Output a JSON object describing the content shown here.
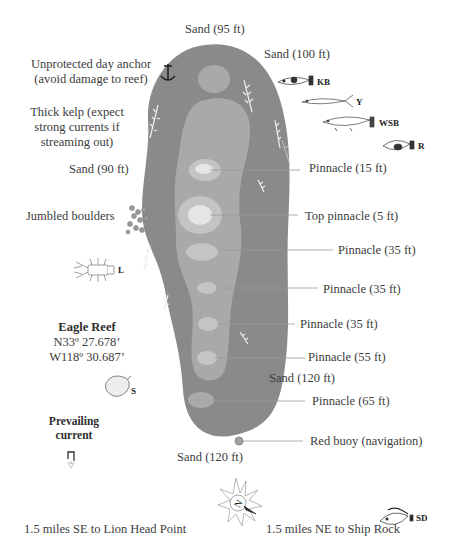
{
  "map": {
    "title": "Eagle Reef",
    "coordinates": {
      "lat": "N33º 27.678’",
      "lon": "W118º 30.687’"
    },
    "colors": {
      "deep": "#8a8a8a",
      "mid": "#a9a9a9",
      "shallow": "#c4c4c4",
      "top": "#e6e6e6",
      "leader": "#9a9a9a"
    }
  },
  "labels": {
    "sand_95": "Sand (95 ft)",
    "sand_100": "Sand (100 ft)",
    "anchor_line1": "Unprotected day anchor",
    "anchor_line2": "(avoid damage to reef)",
    "kelp_line1": "Thick kelp (expect",
    "kelp_line2": "strong currents if",
    "kelp_line3": "streaming out)",
    "sand_90": "Sand (90 ft)",
    "boulders": "Jumbled boulders",
    "pinnacle_15": "Pinnacle (15 ft)",
    "top_pinnacle_5": "Top pinnacle (5 ft)",
    "pinnacle_35a": "Pinnacle (35 ft)",
    "pinnacle_35b": "Pinnacle (35 ft)",
    "pinnacle_35c": "Pinnacle (35 ft)",
    "pinnacle_55": "Pinnacle (55 ft)",
    "sand_120_mid": "Sand (120 ft)",
    "pinnacle_65": "Pinnacle (65 ft)",
    "red_buoy": "Red buoy (navigation)",
    "sand_120_bottom": "Sand (120 ft)",
    "prevailing_line1": "Prevailing",
    "prevailing_line2": "current",
    "lion_head": "1.5 miles SE to Lion Head Point",
    "ship_rock": "1.5 miles NE to Ship Rock"
  },
  "marine_life": [
    {
      "code": "KB",
      "icon": "kelp-bass-icon"
    },
    {
      "code": "Y",
      "icon": "yellowtail-icon"
    },
    {
      "code": "WSB",
      "icon": "white-seabass-icon"
    },
    {
      "code": "R",
      "icon": "rockfish-icon"
    },
    {
      "code": "L",
      "icon": "lobster-icon"
    },
    {
      "code": "S",
      "icon": "scallop-icon"
    },
    {
      "code": "SD",
      "icon": "sand-dab-icon"
    }
  ],
  "compass": {
    "letter": "N",
    "icon": "compass-rose-icon"
  }
}
